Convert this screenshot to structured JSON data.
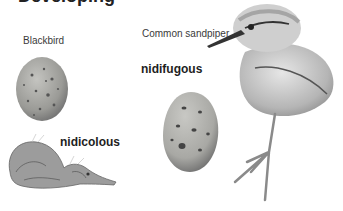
{
  "figure": {
    "cropped_heading": "Developing",
    "labels": {
      "blackbird": "Blackbird",
      "sandpiper": "Common sandpiper",
      "nidicolous": "nidicolous",
      "nidifugous": "nidifugous"
    },
    "colors": {
      "background": "#ffffff",
      "egg_blackbird": "#9a9a96",
      "egg_sandpiper": "#a8a8a4",
      "chick_down": "#bdbdbd",
      "dark_markings": "#3b3b3b"
    }
  }
}
